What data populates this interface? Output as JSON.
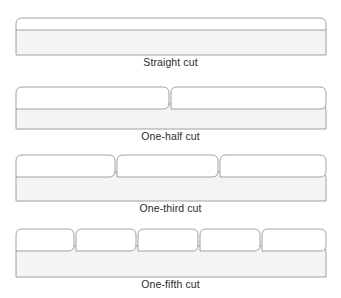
{
  "figure": {
    "background_color": "#ffffff",
    "stroke_color": "#8a8a8a",
    "body_fill_color": "#f4f4f4",
    "tab_fill_color": "#ffffff",
    "text_color": "#2b2b2b"
  },
  "diagram_data": {
    "type": "diagram",
    "subject": "Folder tab cut styles",
    "item_count": 4,
    "items": [
      {
        "id": "straight-cut",
        "caption": "Straight cut",
        "tab_count": 1,
        "tab_fraction": "full width",
        "tab_width_percent": 100,
        "tab_positions_percent": [
          0
        ],
        "body_width": 310,
        "body_height": 30,
        "tab_height": 7
      },
      {
        "id": "one-half-cut",
        "caption": "One-half cut",
        "tab_count": 2,
        "tab_fraction": "1/2",
        "tab_width_percent": 50,
        "tab_positions_percent": [
          0,
          50
        ],
        "body_width": 310,
        "body_height": 26,
        "tab_height": 14
      },
      {
        "id": "one-third-cut",
        "caption": "One-third cut",
        "tab_count": 3,
        "tab_fraction": "1/3",
        "tab_width_percent": 33.33,
        "tab_positions_percent": [
          0,
          33.33,
          66.66
        ],
        "body_width": 310,
        "body_height": 28,
        "tab_height": 14
      },
      {
        "id": "one-fifth-cut",
        "caption": "One-fifth cut",
        "tab_count": 5,
        "tab_fraction": "1/5",
        "tab_width_percent": 20,
        "tab_positions_percent": [
          0,
          20,
          40,
          60,
          80
        ],
        "body_width": 310,
        "body_height": 30,
        "tab_height": 14
      }
    ]
  }
}
